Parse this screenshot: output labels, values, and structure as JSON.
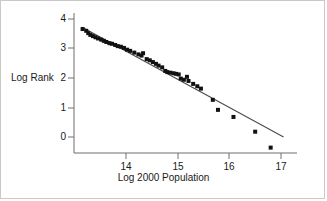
{
  "figure": {
    "background": "#ffffff",
    "border_color": "#c9c9c9",
    "axis_color": "#6e6e6e",
    "marker_color": "#111111",
    "line_color": "#4a4a4a"
  },
  "axis_labels": {
    "x": "Log 2000 Population",
    "y": "Log Rank"
  },
  "ticks": {
    "x": [
      "14",
      "15",
      "16",
      "17"
    ],
    "y": [
      "4",
      "3",
      "2",
      "1",
      "0"
    ]
  },
  "chart_data": {
    "type": "scatter",
    "title": "",
    "xlabel": "Log 2000 Population",
    "ylabel": "Log Rank",
    "xlim": [
      13.0,
      17.3
    ],
    "ylim": [
      -0.65,
      4.15
    ],
    "xticks": [
      14,
      15,
      16,
      17
    ],
    "yticks": [
      0,
      1,
      2,
      3,
      4
    ],
    "grid": false,
    "legend": null,
    "marker": "square",
    "marker_color": "#111111",
    "marker_size_px": 4,
    "points": [
      {
        "x": 13.16,
        "y": 3.66
      },
      {
        "x": 13.23,
        "y": 3.6
      },
      {
        "x": 13.27,
        "y": 3.52
      },
      {
        "x": 13.31,
        "y": 3.46
      },
      {
        "x": 13.36,
        "y": 3.42
      },
      {
        "x": 13.41,
        "y": 3.38
      },
      {
        "x": 13.46,
        "y": 3.34
      },
      {
        "x": 13.52,
        "y": 3.3
      },
      {
        "x": 13.57,
        "y": 3.26
      },
      {
        "x": 13.62,
        "y": 3.22
      },
      {
        "x": 13.68,
        "y": 3.18
      },
      {
        "x": 13.73,
        "y": 3.16
      },
      {
        "x": 13.79,
        "y": 3.12
      },
      {
        "x": 13.84,
        "y": 3.08
      },
      {
        "x": 13.9,
        "y": 3.06
      },
      {
        "x": 13.96,
        "y": 3.02
      },
      {
        "x": 14.02,
        "y": 2.96
      },
      {
        "x": 14.08,
        "y": 2.92
      },
      {
        "x": 14.16,
        "y": 2.86
      },
      {
        "x": 14.24,
        "y": 2.8
      },
      {
        "x": 14.3,
        "y": 2.76
      },
      {
        "x": 14.33,
        "y": 2.84
      },
      {
        "x": 14.4,
        "y": 2.64
      },
      {
        "x": 14.46,
        "y": 2.6
      },
      {
        "x": 14.52,
        "y": 2.54
      },
      {
        "x": 14.58,
        "y": 2.48
      },
      {
        "x": 14.63,
        "y": 2.42
      },
      {
        "x": 14.7,
        "y": 2.36
      },
      {
        "x": 14.76,
        "y": 2.24
      },
      {
        "x": 14.8,
        "y": 2.2
      },
      {
        "x": 14.86,
        "y": 2.18
      },
      {
        "x": 14.92,
        "y": 2.16
      },
      {
        "x": 14.97,
        "y": 2.14
      },
      {
        "x": 15.02,
        "y": 2.12
      },
      {
        "x": 15.06,
        "y": 1.98
      },
      {
        "x": 15.12,
        "y": 1.94
      },
      {
        "x": 15.18,
        "y": 2.04
      },
      {
        "x": 15.21,
        "y": 1.9
      },
      {
        "x": 15.3,
        "y": 1.8
      },
      {
        "x": 15.38,
        "y": 1.72
      },
      {
        "x": 15.45,
        "y": 1.64
      },
      {
        "x": 15.68,
        "y": 1.26
      },
      {
        "x": 15.78,
        "y": 0.92
      },
      {
        "x": 16.08,
        "y": 0.68
      },
      {
        "x": 16.5,
        "y": 0.18
      },
      {
        "x": 16.8,
        "y": -0.36
      }
    ],
    "fit_line": {
      "label": "",
      "x_start": 13.15,
      "y_start": 3.72,
      "x_end": 17.05,
      "y_end": 0.0,
      "color": "#4a4a4a"
    }
  }
}
